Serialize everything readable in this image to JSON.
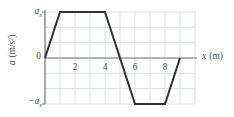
{
  "chart_data": {
    "type": "line",
    "title": "",
    "xlabel": {
      "var": "x",
      "unit": "(m)"
    },
    "ylabel": {
      "var": "a",
      "unit": "(m/s²)"
    },
    "x_ticks": [
      2,
      4,
      6,
      8
    ],
    "xlim": [
      0,
      10
    ],
    "ylim": [
      -1,
      1
    ],
    "y_units": "a_s",
    "y_tick_labels": {
      "top": {
        "base": "a",
        "sub": "s"
      },
      "zero": "0",
      "bottom": {
        "base": "−a",
        "sub": "s"
      }
    },
    "grid": true,
    "legend": false,
    "series": [
      {
        "name": "acceleration vs position",
        "points": [
          [
            0,
            0
          ],
          [
            1,
            1
          ],
          [
            4,
            1
          ],
          [
            6,
            -1
          ],
          [
            8,
            -1
          ],
          [
            9,
            0
          ]
        ]
      }
    ],
    "colors": {
      "curve": "#303030",
      "grid": "#d9e1e3",
      "axis": "#7a7a7a",
      "text": "#4f4f4f"
    }
  }
}
